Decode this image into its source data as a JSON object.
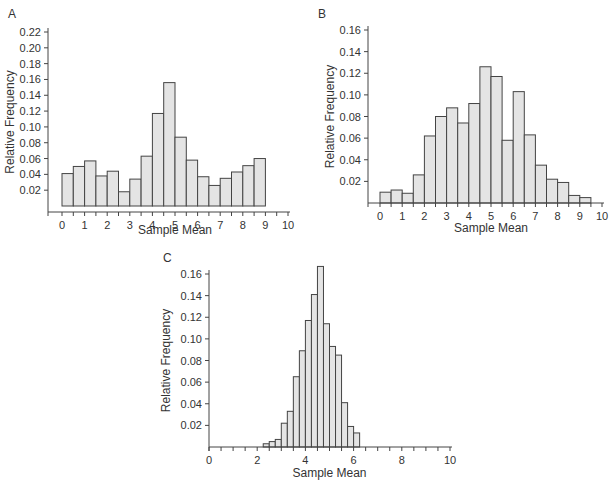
{
  "chart_data": [
    {
      "panel": "A",
      "type": "bar",
      "title": "",
      "xlabel": "Sample Mean",
      "ylabel": "Relative Frequency",
      "xlim": [
        0,
        10
      ],
      "ylim": [
        0,
        0.22
      ],
      "x_ticks": [
        "0",
        "1",
        "2",
        "3",
        "4",
        "5",
        "6",
        "7",
        "8",
        "9",
        "10"
      ],
      "y_ticks": [
        "0.02",
        "0.04",
        "0.06",
        "0.08",
        "0.10",
        "0.12",
        "0.14",
        "0.16",
        "0.18",
        "0.20",
        "0.22"
      ],
      "bin_width": 0.5,
      "bin_start": 0,
      "values": [
        0.041,
        0.05,
        0.057,
        0.038,
        0.044,
        0.018,
        0.034,
        0.063,
        0.117,
        0.156,
        0.087,
        0.058,
        0.037,
        0.026,
        0.035,
        0.043,
        0.051,
        0.06
      ],
      "grid": false
    },
    {
      "panel": "B",
      "type": "bar",
      "title": "",
      "xlabel": "Sample Mean",
      "ylabel": "Relative Frequency",
      "xlim": [
        0,
        10
      ],
      "ylim": [
        0,
        0.16
      ],
      "x_ticks": [
        "0",
        "1",
        "2",
        "3",
        "4",
        "5",
        "6",
        "7",
        "8",
        "9",
        "10"
      ],
      "y_ticks": [
        "0.02",
        "0.04",
        "0.06",
        "0.08",
        "0.10",
        "0.12",
        "0.14",
        "0.16"
      ],
      "bin_width": 0.5,
      "bin_start": 0,
      "values": [
        0.01,
        0.012,
        0.009,
        0.026,
        0.062,
        0.08,
        0.088,
        0.074,
        0.092,
        0.126,
        0.117,
        0.058,
        0.103,
        0.063,
        0.035,
        0.022,
        0.019,
        0.007,
        0.005
      ],
      "grid": false
    },
    {
      "panel": "C",
      "type": "bar",
      "title": "",
      "xlabel": "Sample Mean",
      "ylabel": "Relative Frequency",
      "xlim": [
        0,
        10
      ],
      "ylim": [
        0,
        0.16
      ],
      "x_ticks": [
        "0",
        "2",
        "4",
        "6",
        "8",
        "10"
      ],
      "y_ticks": [
        "0.02",
        "0.04",
        "0.06",
        "0.08",
        "0.10",
        "0.12",
        "0.14",
        "0.16"
      ],
      "bin_width": 0.25,
      "bin_start": 2.25,
      "values": [
        0.003,
        0.005,
        0.007,
        0.022,
        0.033,
        0.065,
        0.089,
        0.117,
        0.141,
        0.167,
        0.114,
        0.093,
        0.085,
        0.041,
        0.019,
        0.013
      ],
      "grid": false
    }
  ]
}
